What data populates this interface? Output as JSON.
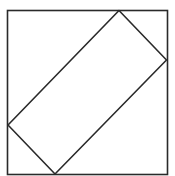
{
  "diagram": {
    "type": "geometric-figure",
    "colors": {
      "stroke": "#2a2a2a",
      "background": "#ffffff"
    },
    "outer_square": {
      "x": 7.5,
      "y": 10.5,
      "width": 160,
      "height": 164
    },
    "inner_rectangle": {
      "points": [
        [
          119,
          10.5
        ],
        [
          166.5,
          60
        ],
        [
          55,
          174
        ],
        [
          8,
          125
        ]
      ]
    }
  }
}
